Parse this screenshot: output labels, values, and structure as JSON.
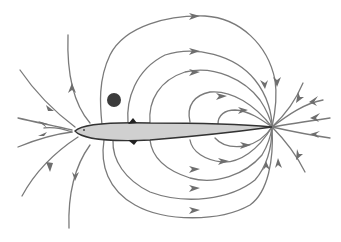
{
  "diagram": {
    "colors": {
      "field_line": "#7a7a7a",
      "arrow": "#6e6e6e",
      "fish_fill": "#d0d0d0",
      "fish_outline": "#333333",
      "object": "#3c3c3c",
      "background": "#ffffff"
    },
    "elements": {
      "fish": "elongated fish body (electric organ), head at left, tail at right",
      "object": "small dark round object above the fish head region",
      "field_lines": "curved lines with arrowheads running from head region around to tail point"
    }
  }
}
